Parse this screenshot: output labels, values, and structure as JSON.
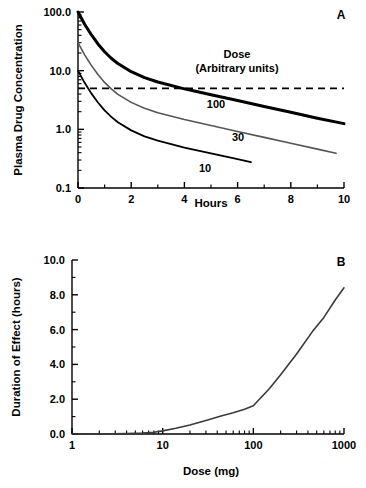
{
  "figure": {
    "panels": [
      {
        "id": "A",
        "label": "A",
        "xlabel": "Hours",
        "ylabel": "Plasma Drug Concentration",
        "legend_title_line1": "Dose",
        "legend_title_line2": "(Arbitrary units)",
        "x_ticks": [
          "0",
          "2",
          "4",
          "6",
          "8",
          "10"
        ],
        "y_ticks": [
          "0.1",
          "1.0",
          "10.0",
          "100.0"
        ],
        "series_labels": [
          "100",
          "30",
          "10"
        ]
      },
      {
        "id": "B",
        "label": "B",
        "xlabel": "Dose (mg)",
        "ylabel": "Duration of Effect (hours)",
        "x_ticks": [
          "1",
          "10",
          "100",
          "1000"
        ],
        "y_ticks": [
          "0.0",
          "2.0",
          "4.0",
          "6.0",
          "8.0",
          "10.0"
        ]
      }
    ]
  },
  "chart_data": [
    {
      "type": "line",
      "panel": "A",
      "title": "",
      "xlabel": "Hours",
      "ylabel": "Plasma Drug Concentration",
      "xlim": [
        0,
        10
      ],
      "ylim": [
        0.1,
        100
      ],
      "yscale": "log",
      "xscale": "linear",
      "grid": false,
      "legend": "inline-labels",
      "legend_title": "Dose (Arbitrary units)",
      "xticks": [
        0,
        2,
        4,
        6,
        8,
        10
      ],
      "xticks_minor": [
        1,
        3,
        5,
        7,
        9
      ],
      "yticks": [
        0.1,
        1.0,
        10.0,
        100.0
      ],
      "annotations": [
        {
          "text": "Dose",
          "x": 5.6,
          "y": 28
        },
        {
          "text": "(Arbitrary units)",
          "x": 5.6,
          "y": 17
        },
        {
          "text": "100",
          "x": 6.2,
          "y": 2.6
        },
        {
          "text": "30",
          "x": 5.6,
          "y": 0.95
        },
        {
          "text": "10",
          "x": 4.0,
          "y": 0.3
        }
      ],
      "threshold_line": {
        "y": 5.0,
        "style": "dashed",
        "label": "minimum effective concentration"
      },
      "series": [
        {
          "name": "100",
          "color": "#000000",
          "width": 3.0,
          "x": [
            0,
            0.25,
            0.5,
            0.75,
            1.0,
            1.25,
            1.5,
            2.0,
            2.5,
            3.0,
            4.0,
            5.0,
            6.0,
            7.0,
            8.0,
            9.0,
            10.0
          ],
          "y": [
            100,
            62,
            41,
            28.5,
            21,
            16.3,
            13.2,
            9.6,
            7.6,
            6.4,
            4.9,
            3.9,
            3.1,
            2.45,
            1.95,
            1.55,
            1.25
          ]
        },
        {
          "name": "30",
          "color": "#555555",
          "width": 1.6,
          "x": [
            0,
            0.25,
            0.5,
            0.75,
            1.0,
            1.25,
            1.5,
            2.0,
            2.5,
            3.0,
            4.0,
            5.0,
            6.0,
            7.0,
            8.0,
            9.0,
            9.7
          ],
          "y": [
            30,
            18.6,
            12.3,
            8.6,
            6.3,
            4.9,
            3.95,
            2.88,
            2.28,
            1.92,
            1.47,
            1.16,
            0.92,
            0.73,
            0.58,
            0.46,
            0.39
          ]
        },
        {
          "name": "10",
          "color": "#000000",
          "width": 1.8,
          "x": [
            0,
            0.25,
            0.5,
            0.75,
            1.0,
            1.25,
            1.5,
            2.0,
            2.5,
            3.0,
            4.0,
            5.0,
            6.0,
            6.5
          ],
          "y": [
            10,
            6.2,
            4.1,
            2.87,
            2.1,
            1.63,
            1.32,
            0.96,
            0.76,
            0.64,
            0.49,
            0.39,
            0.31,
            0.275
          ]
        }
      ]
    },
    {
      "type": "line",
      "panel": "B",
      "title": "",
      "xlabel": "Dose (mg)",
      "ylabel": "Duration of Effect (hours)",
      "xlim": [
        1,
        1000
      ],
      "ylim": [
        0,
        10
      ],
      "xscale": "log",
      "yscale": "linear",
      "grid": false,
      "xticks": [
        1,
        10,
        100,
        1000
      ],
      "yticks": [
        0,
        2,
        4,
        6,
        8,
        10
      ],
      "yticks_minor": [
        1,
        3,
        5,
        7,
        9
      ],
      "series": [
        {
          "name": "duration",
          "color": "#3a3a3a",
          "width": 1.6,
          "x": [
            1,
            2,
            4,
            6,
            8,
            10,
            14,
            20,
            30,
            45,
            60,
            80,
            100,
            150,
            200,
            300,
            450,
            600,
            800,
            1000
          ],
          "y": [
            0.0,
            0.0,
            0.02,
            0.05,
            0.1,
            0.18,
            0.33,
            0.52,
            0.78,
            1.05,
            1.22,
            1.42,
            1.62,
            2.6,
            3.4,
            4.6,
            5.9,
            6.7,
            7.7,
            8.4
          ]
        }
      ]
    }
  ]
}
